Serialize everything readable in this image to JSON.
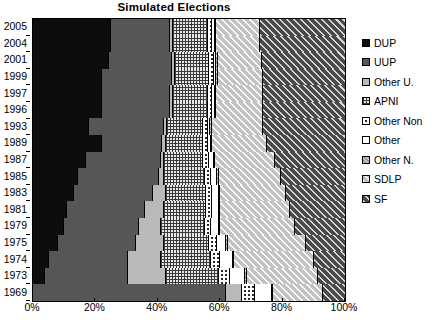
{
  "chart_data": {
    "type": "bar",
    "orientation": "horizontal",
    "stacked": true,
    "normalized_percent": true,
    "title": "Simulated Elections",
    "xlabel": "",
    "ylabel": "",
    "xlim": [
      0,
      100
    ],
    "xticks": [
      "0%",
      "20%",
      "40%",
      "60%",
      "80%",
      "100%"
    ],
    "xtick_values": [
      0,
      20,
      40,
      60,
      80,
      100
    ],
    "grid": false,
    "legend_position": "right",
    "categories": [
      "2005",
      "2004",
      "2001",
      "1999",
      "1997",
      "1996",
      "1993",
      "1989",
      "1987",
      "1985",
      "1983",
      "1981",
      "1979",
      "1975",
      "1974",
      "1973",
      "1969"
    ],
    "series": [
      {
        "name": "DUP",
        "color": "#0d0d0d",
        "pattern": "solid",
        "values": [
          25.0,
          25.0,
          24.5,
          22.0,
          22.0,
          22.0,
          18.0,
          22.0,
          17.0,
          14.5,
          13.0,
          11.0,
          10.0,
          8.0,
          5.0,
          4.0,
          0.0
        ]
      },
      {
        "name": "UUP",
        "color": "#565656",
        "pattern": "solid",
        "values": [
          19.0,
          19.0,
          20.0,
          22.5,
          22.0,
          22.0,
          24.0,
          19.5,
          24.0,
          26.0,
          25.5,
          25.0,
          24.0,
          25.0,
          25.5,
          26.5,
          62.0
        ]
      },
      {
        "name": "Other U.",
        "color": "#b9b9b9",
        "pattern": "solid",
        "values": [
          1.0,
          1.0,
          1.0,
          1.0,
          1.0,
          1.0,
          1.0,
          1.0,
          1.0,
          1.5,
          4.0,
          6.0,
          7.0,
          9.0,
          10.5,
          12.0,
          5.0
        ]
      },
      {
        "name": "APNI",
        "color": "#e8e8e8",
        "pattern": "crosshatch-dot",
        "values": [
          11.0,
          11.0,
          11.0,
          11.0,
          11.0,
          11.0,
          11.5,
          12.0,
          12.5,
          13.0,
          13.0,
          13.5,
          14.0,
          14.5,
          16.0,
          17.0,
          0.0
        ]
      },
      {
        "name": "Other Non",
        "color": "#ffffff",
        "pattern": "dots",
        "values": [
          1.5,
          1.5,
          1.5,
          1.5,
          1.5,
          1.5,
          1.5,
          1.5,
          2.0,
          2.0,
          2.0,
          2.0,
          2.0,
          2.5,
          3.0,
          3.5,
          4.0
        ]
      },
      {
        "name": "Other",
        "color": "#ffffff",
        "pattern": "none",
        "values": [
          0.8,
          0.8,
          0.8,
          0.8,
          0.8,
          0.8,
          0.8,
          1.0,
          1.5,
          2.0,
          2.0,
          2.0,
          2.5,
          3.0,
          4.0,
          5.0,
          5.5
        ]
      },
      {
        "name": "Other N.",
        "color": "#9a9a9a",
        "pattern": "fine-diagonal",
        "values": [
          0.5,
          0.5,
          0.5,
          0.5,
          0.5,
          0.5,
          0.5,
          0.5,
          0.5,
          0.5,
          0.5,
          0.5,
          0.5,
          0.5,
          0.5,
          0.5,
          0.5
        ]
      },
      {
        "name": "SDLP",
        "color": "#c3c3c3",
        "pattern": "diagonal-hatch",
        "values": [
          14.0,
          14.0,
          14.0,
          14.5,
          15.0,
          15.0,
          16.5,
          17.5,
          19.0,
          20.0,
          21.0,
          22.5,
          24.0,
          25.0,
          25.5,
          23.0,
          16.0
        ]
      },
      {
        "name": "SF",
        "color": "#4a4a4a",
        "pattern": "diagonal-hatch-dark",
        "values": [
          27.2,
          27.2,
          26.7,
          26.2,
          26.2,
          26.2,
          26.2,
          25.0,
          22.5,
          20.5,
          19.0,
          17.5,
          16.0,
          12.5,
          10.0,
          8.5,
          7.0
        ]
      }
    ]
  },
  "legend": {
    "items": [
      {
        "label": "DUP"
      },
      {
        "label": "UUP"
      },
      {
        "label": "Other U."
      },
      {
        "label": "APNI"
      },
      {
        "label": "Other Non"
      },
      {
        "label": "Other"
      },
      {
        "label": "Other N."
      },
      {
        "label": "SDLP"
      },
      {
        "label": "SF"
      }
    ]
  }
}
